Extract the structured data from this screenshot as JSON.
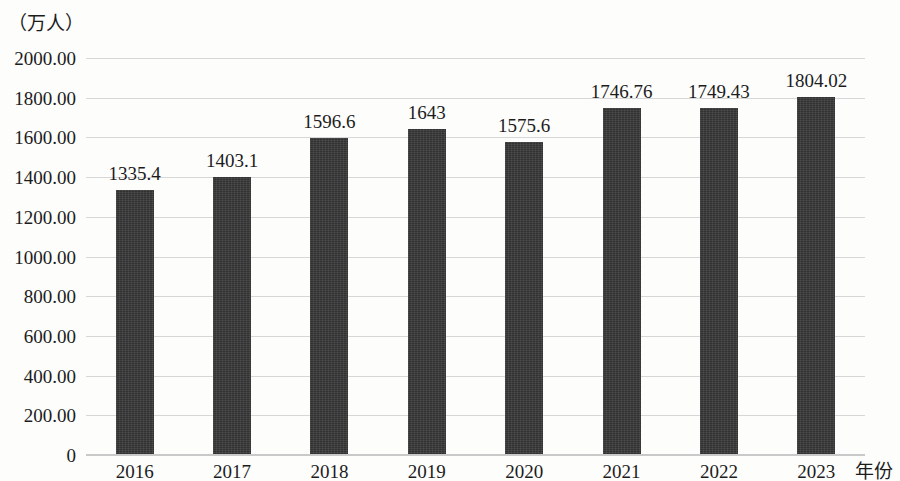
{
  "chart_data": {
    "type": "bar",
    "title": "",
    "subtitle": "",
    "xlabel": "年份",
    "ylabel": "（万人）",
    "categories": [
      "2016",
      "2017",
      "2018",
      "2019",
      "2020",
      "2021",
      "2022",
      "2023"
    ],
    "values": [
      1335.4,
      1403.1,
      1596.6,
      1643,
      1575.6,
      1746.76,
      1749.43,
      1804.02
    ],
    "value_labels": [
      "1335.4",
      "1403.1",
      "1596.6",
      "1643",
      "1575.6",
      "1746.76",
      "1749.43",
      "1804.02"
    ],
    "series": [
      {
        "name": "",
        "values": [
          1335.4,
          1403.1,
          1596.6,
          1643,
          1575.6,
          1746.76,
          1749.43,
          1804.02
        ],
        "color": "#383838"
      }
    ],
    "ylim": [
      0,
      2000
    ],
    "y_ticks": [
      0,
      200,
      400,
      600,
      800,
      1000,
      1200,
      1400,
      1600,
      1800,
      2000
    ],
    "y_tick_labels": [
      "0",
      "200.00",
      "400.00",
      "600.00",
      "800.00",
      "1000.00",
      "1200.00",
      "1400.00",
      "1600.00",
      "1800.00",
      "2000.00"
    ],
    "grid": true,
    "gridline_color": "#d7d7d7",
    "legend": "none",
    "bar_color": "#383838",
    "background_color": "#fdfdfc"
  }
}
